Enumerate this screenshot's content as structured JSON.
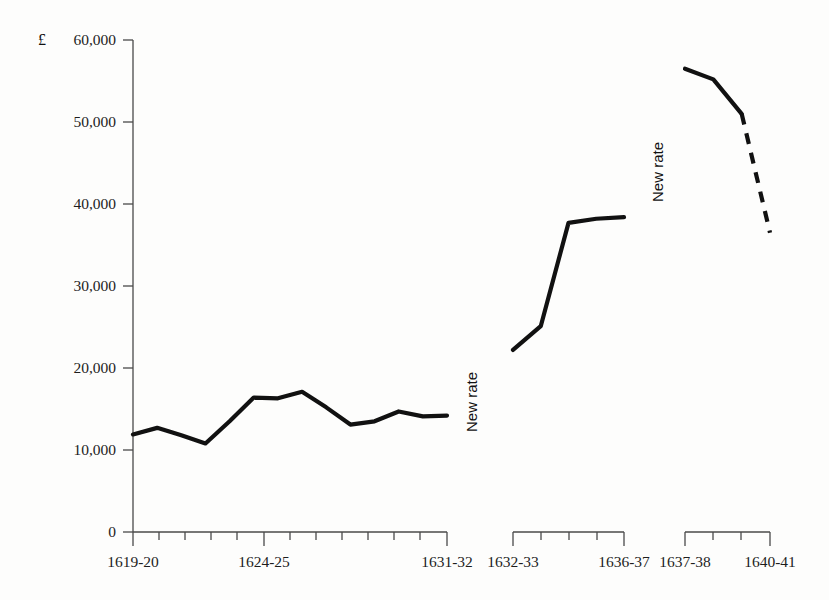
{
  "chart_data": {
    "type": "line",
    "title": "",
    "xlabel": "",
    "ylabel": "£",
    "ylim": [
      0,
      60000
    ],
    "y_ticks": [
      0,
      10000,
      20000,
      30000,
      40000,
      50000,
      60000
    ],
    "y_tick_labels": [
      "0",
      "10,000",
      "20,000",
      "30,000",
      "40,000",
      "50,000",
      "60,000"
    ],
    "grid": false,
    "legend": "none",
    "axis_breaks": true,
    "segments": [
      {
        "name": "segment-1",
        "x_start_label": "1619-20",
        "x_mid_label": "1624-25",
        "x_end_label": "1631-32",
        "categories": [
          "1619-20",
          "1620-21",
          "1621-22",
          "1622-23",
          "1623-24",
          "1624-25",
          "1625-26",
          "1626-27",
          "1627-28",
          "1628-29",
          "1629-30",
          "1630-31",
          "1631-32"
        ],
        "values": [
          11900,
          12700,
          11800,
          10800,
          13500,
          16400,
          16300,
          17100,
          15200,
          13100,
          13500,
          14700,
          14100,
          14200
        ],
        "style": "solid"
      },
      {
        "name": "segment-2",
        "x_start_label": "1632-33",
        "x_end_label": "1636-37",
        "categories": [
          "1632-33",
          "1633-34",
          "1634-35",
          "1635-36",
          "1636-37"
        ],
        "values": [
          22200,
          25100,
          37700,
          38200,
          38400
        ],
        "style": "solid",
        "annotation": "New rate"
      },
      {
        "name": "segment-3",
        "x_start_label": "1637-38",
        "x_end_label": "1640-41",
        "categories": [
          "1637-38",
          "1638-39",
          "1639-40",
          "1640-41"
        ],
        "values": [
          56500,
          55200,
          51000,
          36500
        ],
        "style": "solid-then-dashed",
        "dashed_from_index": 2,
        "annotation": "New rate"
      }
    ]
  },
  "axis": {
    "currency_symbol": "£",
    "y_tick_labels": [
      "60,000",
      "50,000",
      "40,000",
      "30,000",
      "20,000",
      "10,000",
      "0"
    ],
    "x_segment_labels": {
      "seg1_start": "1619-20",
      "seg1_mid": "1624-25",
      "seg1_end": "1631-32",
      "seg2_start": "1632-33",
      "seg2_end": "1636-37",
      "seg3_start": "1637-38",
      "seg3_end": "1640-41"
    }
  },
  "annotations": {
    "new_rate_1": "New rate",
    "new_rate_2": "New rate"
  },
  "colors": {
    "line": "#111111",
    "axis": "#4a4a4a",
    "text": "#1d1d1d",
    "background": "#fdfdfc"
  }
}
